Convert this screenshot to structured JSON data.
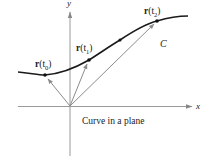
{
  "figure": {
    "caption": "Curve in a plane",
    "axes": {
      "x_label": "x",
      "y_label": "y"
    },
    "curve_label": "C",
    "points": [
      {
        "label_bold": "r",
        "label_rest": "(t",
        "sub": "0",
        "close": ")"
      },
      {
        "label_bold": "r",
        "label_rest": "(t",
        "sub": "1",
        "close": ")"
      },
      {
        "label_bold": "r",
        "label_rest": "(t",
        "sub": "2",
        "close": ")"
      }
    ],
    "colors": {
      "curve": "#1a1a1a",
      "vectors": "#8c8c8c",
      "axes": "#9a9a9a"
    }
  }
}
